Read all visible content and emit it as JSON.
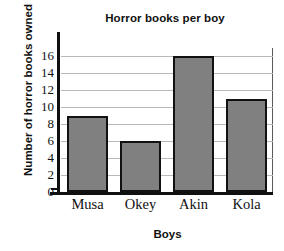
{
  "chart_data": {
    "type": "bar",
    "title": "Horror books per boy",
    "xlabel": "Boys",
    "ylabel": "Number of horror books owned",
    "categories": [
      "Musa",
      "Okey",
      "Akin",
      "Kola"
    ],
    "values": [
      9,
      6,
      16,
      11
    ],
    "ylim": [
      0,
      17
    ],
    "yticks": [
      0,
      2,
      4,
      6,
      8,
      10,
      12,
      14,
      16
    ],
    "ytick_labels": [
      "0",
      "2",
      "4",
      "6",
      "8",
      "10",
      "12",
      "14",
      "16"
    ],
    "grid": true,
    "legend": false,
    "bar_color": "#808080",
    "bar_edge_color": "#111111",
    "grid_color": "#b9b9b9",
    "axis_color": "#101010",
    "background": "#ffffff"
  }
}
